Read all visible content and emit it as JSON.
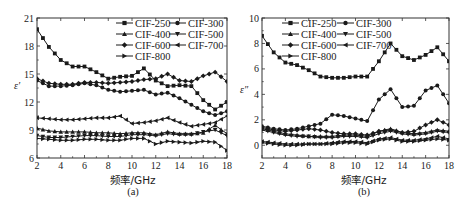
{
  "chart_data": [
    {
      "type": "line",
      "panel": "(a)",
      "title": "",
      "xlabel": "频率/GHz",
      "ylabel": "ε′",
      "xlim": [
        2,
        18
      ],
      "ylim": [
        6,
        21
      ],
      "xticks": [
        2,
        4,
        6,
        8,
        10,
        12,
        14,
        16,
        18
      ],
      "yticks": [
        6,
        9,
        12,
        15,
        18,
        21
      ],
      "legend_position": "upper right",
      "x": [
        2,
        3,
        4,
        5,
        6,
        7,
        8,
        9,
        10,
        11,
        12,
        13,
        14,
        15,
        16,
        17,
        18
      ],
      "series": [
        {
          "name": "CIF-250",
          "marker": "square",
          "values": [
            19.8,
            17.9,
            16.5,
            15.8,
            15.8,
            15.2,
            14.5,
            14.7,
            14.8,
            15.6,
            14.3,
            13.7,
            13.8,
            13.7,
            12.2,
            11.2,
            12.0
          ]
        },
        {
          "name": "CIF-300",
          "marker": "circle",
          "values": [
            14.3,
            13.7,
            13.7,
            13.8,
            14.0,
            13.8,
            13.3,
            13.1,
            13.2,
            13.3,
            12.8,
            13.0,
            12.4,
            11.7,
            11.0,
            10.6,
            11.0
          ]
        },
        {
          "name": "CIF-400",
          "marker": "triangle-up",
          "values": [
            9.2,
            8.9,
            8.8,
            8.8,
            8.8,
            8.7,
            8.7,
            8.6,
            8.7,
            8.7,
            8.5,
            8.8,
            8.6,
            8.6,
            8.7,
            9.5,
            8.6
          ]
        },
        {
          "name": "CIF-500",
          "marker": "triangle-down",
          "values": [
            8.4,
            8.2,
            8.2,
            8.3,
            8.4,
            8.4,
            8.3,
            8.3,
            8.5,
            8.5,
            8.4,
            8.6,
            8.5,
            8.5,
            8.8,
            9.0,
            8.4
          ]
        },
        {
          "name": "CIF-600",
          "marker": "diamond",
          "values": [
            14.5,
            14.0,
            13.9,
            13.9,
            14.1,
            14.1,
            14.0,
            14.1,
            14.2,
            14.4,
            14.5,
            15.0,
            14.3,
            14.2,
            14.8,
            15.2,
            14.2
          ]
        },
        {
          "name": "CIF-700",
          "marker": "triangle-left",
          "values": [
            10.3,
            10.2,
            10.1,
            10.1,
            10.2,
            10.3,
            10.3,
            10.5,
            9.7,
            9.8,
            10.0,
            10.3,
            9.8,
            9.4,
            9.6,
            9.8,
            10.5
          ]
        },
        {
          "name": "CIF-800",
          "marker": "triangle-right",
          "values": [
            8.1,
            8.0,
            7.9,
            7.9,
            8.0,
            8.0,
            7.9,
            7.9,
            8.1,
            8.1,
            7.5,
            7.8,
            7.7,
            7.6,
            7.8,
            7.7,
            6.8
          ]
        }
      ]
    },
    {
      "type": "line",
      "panel": "(b)",
      "title": "",
      "xlabel": "频率/GHz",
      "ylabel": "ε″",
      "xlim": [
        2,
        18
      ],
      "ylim": [
        -1,
        10
      ],
      "xticks": [
        2,
        4,
        6,
        8,
        10,
        12,
        14,
        16,
        18
      ],
      "yticks": [
        0,
        2,
        4,
        6,
        8,
        10
      ],
      "legend_position": "upper left",
      "x": [
        2,
        3,
        4,
        5,
        6,
        7,
        8,
        9,
        10,
        11,
        12,
        13,
        14,
        15,
        16,
        17,
        18
      ],
      "series": [
        {
          "name": "CIF-250",
          "marker": "square",
          "values": [
            8.6,
            7.3,
            6.5,
            6.3,
            5.9,
            5.4,
            5.3,
            5.3,
            5.4,
            5.4,
            6.6,
            8.0,
            7.0,
            6.7,
            7.1,
            7.7,
            6.6
          ]
        },
        {
          "name": "CIF-300",
          "marker": "circle",
          "values": [
            1.5,
            1.3,
            1.2,
            1.3,
            1.5,
            1.7,
            2.4,
            2.3,
            2.1,
            1.9,
            3.6,
            4.4,
            3.0,
            3.1,
            4.3,
            4.7,
            3.3
          ]
        },
        {
          "name": "CIF-400",
          "marker": "triangle-up",
          "values": [
            1.3,
            1.1,
            0.9,
            0.8,
            0.7,
            0.7,
            0.7,
            0.8,
            0.8,
            0.7,
            1.1,
            1.3,
            1.0,
            0.9,
            1.0,
            1.2,
            1.1
          ]
        },
        {
          "name": "CIF-500",
          "marker": "triangle-down",
          "values": [
            1.2,
            1.0,
            0.8,
            0.7,
            0.7,
            0.6,
            0.6,
            0.7,
            0.7,
            0.6,
            0.9,
            1.1,
            0.9,
            0.8,
            0.9,
            1.1,
            1.0
          ]
        },
        {
          "name": "CIF-600",
          "marker": "diamond",
          "values": [
            1.4,
            1.2,
            1.1,
            1.2,
            1.3,
            1.2,
            1.0,
            0.9,
            0.9,
            0.8,
            1.1,
            1.2,
            1.0,
            1.1,
            1.6,
            2.0,
            1.6
          ]
        },
        {
          "name": "CIF-700",
          "marker": "triangle-left",
          "values": [
            0.3,
            0.2,
            0.1,
            0.1,
            0.1,
            0.1,
            0.2,
            0.3,
            0.3,
            0.2,
            0.5,
            0.6,
            0.4,
            0.4,
            0.5,
            0.7,
            0.5
          ]
        },
        {
          "name": "CIF-800",
          "marker": "triangle-right",
          "values": [
            0.2,
            0.1,
            0.0,
            0.0,
            0.1,
            0.1,
            0.1,
            0.2,
            0.2,
            0.1,
            0.4,
            0.5,
            0.3,
            0.3,
            0.4,
            0.5,
            0.4
          ]
        }
      ]
    }
  ],
  "panels": {
    "a": {
      "caption": "(a)",
      "xlabel": "频率/GHz",
      "ylabel": "ε′"
    },
    "b": {
      "caption": "(b)",
      "xlabel": "频率/GHz",
      "ylabel": "ε″"
    }
  },
  "legend": [
    "CIF-250",
    "CIF-300",
    "CIF-400",
    "CIF-500",
    "CIF-600",
    "CIF-700",
    "CIF-800"
  ],
  "style": {
    "line_color": "#1a1a1a",
    "axis_color": "#333333"
  }
}
